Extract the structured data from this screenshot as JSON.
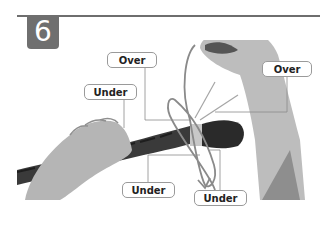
{
  "step": {
    "number": "6"
  },
  "labels": {
    "over_top_left": "Over",
    "over_right": "Over",
    "under_left": "Under",
    "under_bottom_left": "Under",
    "under_bottom_right": "Under"
  },
  "colors": {
    "badge": "#6f6f6f",
    "rule": "#6e6e6e",
    "label_border": "#9a9a9a",
    "rope": "#2e2e2e",
    "whipping": "#c8c8c8",
    "line": "#8a8a8a",
    "skin": "#b8b8b8"
  }
}
